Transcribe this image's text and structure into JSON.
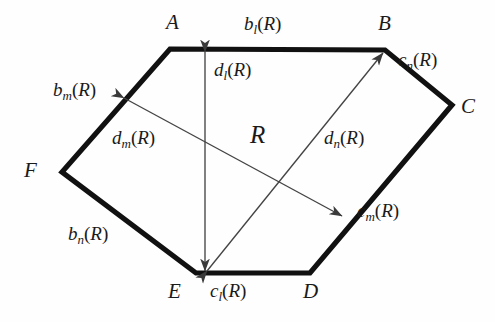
{
  "figure": {
    "caption_region_label": "R",
    "background_color": "#fefefe",
    "ink_color": "#111111",
    "thin_line_color": "#444444",
    "vertices": [
      {
        "name": "A",
        "label": "A",
        "x": 170,
        "y": 49,
        "label_x": 166,
        "label_y": 12
      },
      {
        "name": "B",
        "label": "B",
        "x": 385,
        "y": 50,
        "label_x": 378,
        "label_y": 13
      },
      {
        "name": "C",
        "label": "C",
        "x": 452,
        "y": 105,
        "label_x": 461,
        "label_y": 96
      },
      {
        "name": "D",
        "label": "D",
        "x": 310,
        "y": 273,
        "label_x": 303,
        "label_y": 281
      },
      {
        "name": "E",
        "label": "E",
        "x": 196,
        "y": 273,
        "label_x": 168,
        "label_y": 281
      },
      {
        "name": "F",
        "label": "F",
        "x": 62,
        "y": 172,
        "label_x": 24,
        "label_y": 160
      }
    ],
    "edge_labels": [
      {
        "name": "edge-label-b-l",
        "base": "b",
        "sub": "l",
        "arg": "R",
        "x": 244,
        "y": 14,
        "edge": "A-B"
      },
      {
        "name": "edge-label-c-n",
        "base": "c",
        "sub": "n",
        "arg": "R",
        "x": 398,
        "y": 50,
        "edge": "B-C"
      },
      {
        "name": "edge-label-c-m",
        "base": "c",
        "sub": "m",
        "arg": "R",
        "x": 357,
        "y": 201,
        "edge": "C-D"
      },
      {
        "name": "edge-label-c-l",
        "base": "c",
        "sub": "l",
        "arg": "R",
        "x": 210,
        "y": 281,
        "edge": "D-E"
      },
      {
        "name": "edge-label-b-n",
        "base": "b",
        "sub": "n",
        "arg": "R",
        "x": 68,
        "y": 224,
        "edge": "E-F"
      },
      {
        "name": "edge-label-b-m",
        "base": "b",
        "sub": "m",
        "arg": "R",
        "x": 53,
        "y": 80,
        "edge": "F-A"
      }
    ],
    "diameter_labels": [
      {
        "name": "diameter-label-d-l",
        "base": "d",
        "sub": "l",
        "arg": "R",
        "x": 214,
        "y": 60
      },
      {
        "name": "diameter-label-d-m",
        "base": "d",
        "sub": "m",
        "arg": "R",
        "x": 112,
        "y": 128
      },
      {
        "name": "diameter-label-d-n",
        "base": "d",
        "sub": "n",
        "arg": "R",
        "x": 324,
        "y": 128
      }
    ],
    "diameters": [
      {
        "name": "diameter-arrow-d-l",
        "x1": 205,
        "y1": 52,
        "x2": 205,
        "y2": 271
      },
      {
        "name": "diameter-arrow-d-m",
        "x1": 124,
        "y1": 98,
        "x2": 342,
        "y2": 216
      },
      {
        "name": "diameter-arrow-d-n",
        "x1": 207,
        "y1": 271,
        "x2": 383,
        "y2": 53
      }
    ],
    "region_label": {
      "name": "region-label",
      "text": "R",
      "x": 250,
      "y": 122
    },
    "hexagon_path": "M170,49 L385,50 L452,105 L310,273 L196,273 L62,172 Z"
  }
}
